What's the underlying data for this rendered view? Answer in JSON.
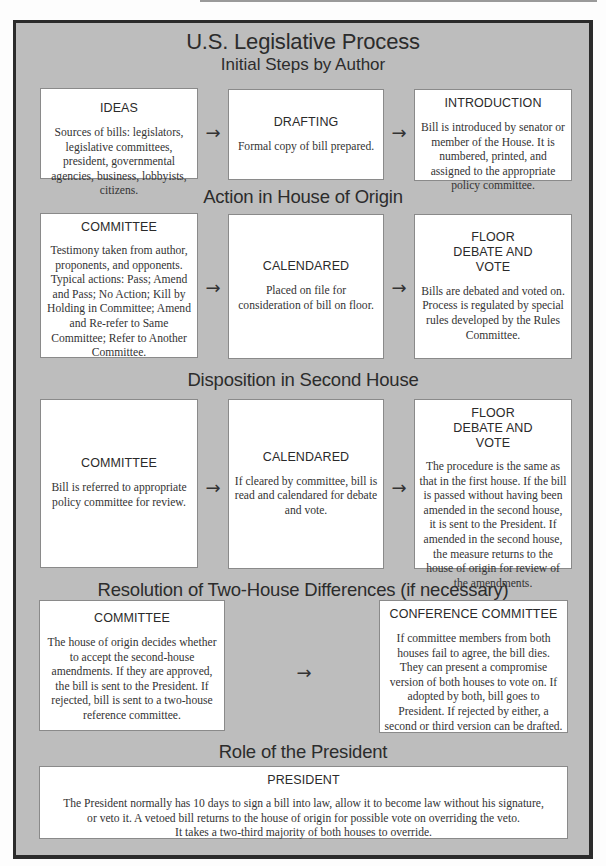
{
  "title": "U.S. Legislative Process",
  "subtitle": "Initial Steps by Author",
  "arrow_glyph": "→",
  "sections": [
    {
      "heading": "",
      "boxes": [
        {
          "title": "IDEAS",
          "body": "Sources of bills: legislators, legislative committees, president, governmental agencies, business, lobbyists, citizens."
        },
        {
          "title": "DRAFTING",
          "body": "Formal copy of bill prepared."
        },
        {
          "title": "INTRODUCTION",
          "body": "Bill is introduced by senator or member of the House.  It is numbered, printed, and assigned to the appropriate policy committee."
        }
      ]
    },
    {
      "heading": "Action in House of Origin",
      "boxes": [
        {
          "title": "COMMITTEE",
          "body": "Testimony taken from author, proponents, and opponents. Typical actions: Pass; Amend and Pass; No Action; Kill by Holding in Committee; Amend and Re-refer to Same Committee; Refer to Another Committee."
        },
        {
          "title": "CALENDARED",
          "body": "Placed on file for consideration of bill on floor."
        },
        {
          "title": "FLOOR DEBATE AND VOTE",
          "body": "Bills are debated and voted on. Process is regulated by special rules developed by the Rules Committee."
        }
      ]
    },
    {
      "heading": "Disposition in Second House",
      "boxes": [
        {
          "title": "COMMITTEE",
          "body": "Bill is referred to appropriate policy committee for review."
        },
        {
          "title": "CALENDARED",
          "body": "If cleared by committee, bill is read and calendared for debate and vote."
        },
        {
          "title": "FLOOR DEBATE AND VOTE",
          "body": "The procedure is the same as that in the first house.  If the bill is passed without having been amended in the second house, it is sent to the President.  If amended in the second house, the measure returns to the house of origin for review of the amendments."
        }
      ]
    },
    {
      "heading": "Resolution of Two-House Differences (if necessary)",
      "boxes": [
        {
          "title": "COMMITTEE",
          "body": "The house of origin decides whether to accept the second-house amendments.  If they are approved, the bill is sent to the President.  If rejected, bill is sent to a two-house reference committee."
        },
        {
          "title": "CONFERENCE COMMITTEE",
          "body": "If committee members from both houses fail to agree, the bill dies. They can present a compromise version of both houses to vote on.  If adopted by both, bill goes to President. If rejected by either, a second or third version can be drafted."
        }
      ]
    },
    {
      "heading": "Role of the President",
      "boxes": [
        {
          "title": "PRESIDENT",
          "body_lines": [
            "The President normally has 10 days to sign a bill into law, allow it to become law without his signature,",
            "or veto it.  A vetoed bill returns to the house of origin for possible vote on overriding the veto.",
            "It takes a two-third majority of both houses to override."
          ]
        }
      ]
    }
  ],
  "colors": {
    "frame_fill": "#bdbdbd",
    "frame_border": "#2b2b2b",
    "box_fill": "#ffffff",
    "text": "#2a2a2a"
  }
}
